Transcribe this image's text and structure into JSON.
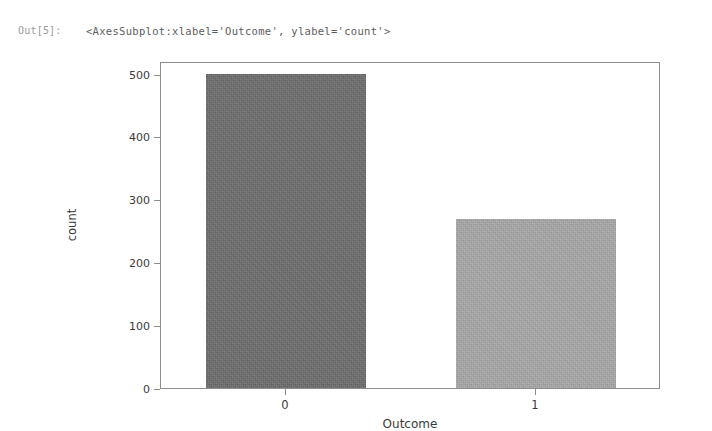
{
  "notebook": {
    "output_prompt": "Out[5]:",
    "repr_text": "<AxesSubplot:xlabel='Outcome', ylabel='count'>"
  },
  "chart_data": {
    "type": "bar",
    "title": "",
    "categories": [
      "0",
      "1"
    ],
    "values": [
      500,
      268
    ],
    "xlabel": "Outcome",
    "ylabel": "count",
    "ylim": [
      0,
      520
    ],
    "yticks": [
      0,
      100,
      200,
      300,
      400,
      500
    ],
    "ytick_labels": [
      "0",
      "100",
      "200",
      "300",
      "400",
      "500"
    ],
    "xtick_labels": [
      "0",
      "1"
    ],
    "grid": false,
    "legend": "none",
    "bar_colors": [
      "#6d6d6d",
      "#a8a8a8"
    ],
    "spine_color": "#8d8d8d",
    "background": "#ffffff"
  }
}
